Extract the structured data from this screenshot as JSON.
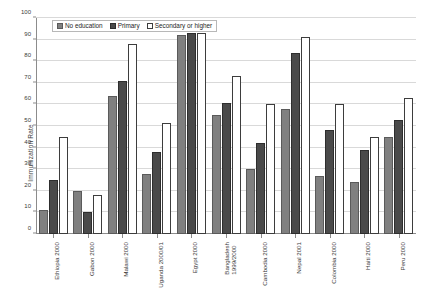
{
  "chart_data": {
    "type": "bar",
    "title": "",
    "xlabel": "",
    "ylabel": "Immunization Rate",
    "ylim": [
      0,
      100
    ],
    "ytick_step": 10,
    "yticks": [
      0,
      10,
      20,
      30,
      40,
      50,
      60,
      70,
      80,
      90,
      100
    ],
    "grid": true,
    "legend_position": "top-left inside plot",
    "categories": [
      "Ethiopia 2000",
      "Gabon 2000",
      "Malawi 2000",
      "Uganda 2000/01",
      "Egypt 2000",
      "Bangladesh 1999/2000",
      "Cambodia 2000",
      "Nepal 2001",
      "Colombia 2000",
      "Haiti 2000",
      "Peru 2000"
    ],
    "category_lines": [
      [
        "Ethiopia 2000"
      ],
      [
        "Gabon 2000"
      ],
      [
        "Malawi 2000"
      ],
      [
        "Uganda 2000/01"
      ],
      [
        "Egypt 2000"
      ],
      [
        "Bangladesh",
        "1999/2000"
      ],
      [
        "Cambodia 2000"
      ],
      [
        "Nepal 2001"
      ],
      [
        "Colombia 2000"
      ],
      [
        "Haiti 2000"
      ],
      [
        "Peru 2000"
      ]
    ],
    "series": [
      {
        "name": "No education",
        "color": "#808080",
        "values": [
          11,
          20,
          64,
          28,
          92,
          55,
          30,
          58,
          27,
          24,
          45
        ]
      },
      {
        "name": "Primary",
        "color": "#4a4a4a",
        "values": [
          25,
          10,
          71,
          38,
          93,
          60.5,
          42,
          84,
          48,
          39,
          53
        ]
      },
      {
        "name": "Secondary or higher",
        "color": "#ffffff",
        "values": [
          45,
          18,
          88,
          51.5,
          93,
          73,
          60,
          91,
          60,
          45,
          63
        ]
      }
    ]
  },
  "legend": {
    "items": [
      {
        "label": "No education"
      },
      {
        "label": "Primary"
      },
      {
        "label": "Secondary or higher"
      }
    ]
  }
}
